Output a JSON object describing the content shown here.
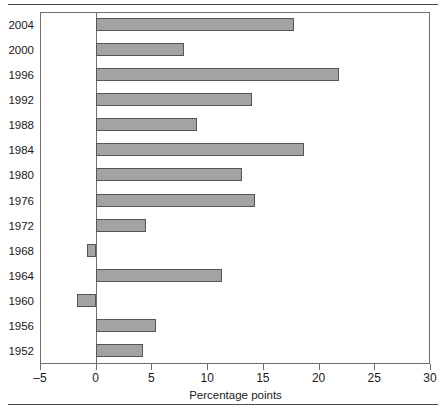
{
  "chart_data": {
    "type": "bar",
    "orientation": "horizontal",
    "title": "",
    "xlabel": "Percentage points",
    "ylabel": "",
    "xlim": [
      -5,
      30
    ],
    "ylim": null,
    "grid": false,
    "legend": null,
    "xticks": [
      -5,
      0,
      5,
      10,
      15,
      20,
      25,
      30
    ],
    "xtick_labels": [
      "–5",
      "0",
      "5",
      "10",
      "15",
      "20",
      "25",
      "30"
    ],
    "categories": [
      "2004",
      "2000",
      "1996",
      "1992",
      "1988",
      "1984",
      "1980",
      "1976",
      "1972",
      "1968",
      "1964",
      "1960",
      "1956",
      "1952"
    ],
    "values": [
      17.8,
      7.9,
      21.8,
      14.0,
      9.1,
      18.7,
      13.1,
      14.3,
      4.5,
      -0.8,
      11.3,
      -1.7,
      5.4,
      4.2
    ],
    "bar_color": "#a3a3a3",
    "bar_edge_color": "#555555",
    "axis_color": "#6e6e6e",
    "zero_reference": 0
  },
  "figure": {
    "rule_color": "#4a4a4a",
    "background": "#ffffff"
  }
}
